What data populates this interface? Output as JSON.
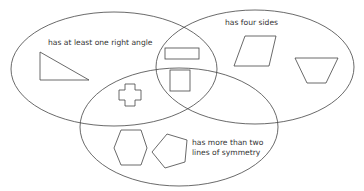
{
  "diagram": {
    "type": "venn",
    "sets": [
      {
        "id": "right-angle",
        "label": "has at least one right angle"
      },
      {
        "id": "four-sides",
        "label": "has four sides"
      },
      {
        "id": "symmetry",
        "label_line1": "has more than two",
        "label_line2": "lines of symmetry"
      }
    ],
    "regions": {
      "right_angle_only": [
        "right triangle"
      ],
      "four_sides_only": [
        "parallelogram",
        "trapezium"
      ],
      "right_angle_and_four_sides": [
        "rectangle"
      ],
      "right_angle_and_symmetry": [
        "cross"
      ],
      "all_three": [
        "square"
      ],
      "symmetry_only": [
        "hexagon",
        "pentagon"
      ]
    },
    "colors": {
      "stroke": "#444444",
      "text": "#333333",
      "background": "#ffffff"
    }
  }
}
